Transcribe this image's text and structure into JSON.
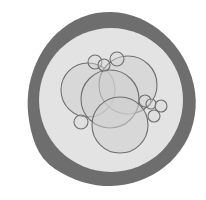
{
  "figure": {
    "width": 206,
    "height": 200,
    "background": "#ffffff",
    "outer_ring": {
      "cx": 111,
      "cy": 100,
      "rx": 84,
      "ry": 87,
      "color": "#6e6e6e"
    },
    "inner_disc": {
      "cx": 111,
      "cy": 100,
      "r": 72,
      "color": "#e3e3e3"
    },
    "circle_style": {
      "fill": "#cfcfcf",
      "fill_opacity": 0.55,
      "stroke": "#6f6f6f",
      "stroke_width": 1.1
    },
    "large_circles": [
      {
        "id": "left",
        "cx": 88,
        "cy": 90,
        "r": 27
      },
      {
        "id": "top-right",
        "cx": 128,
        "cy": 85,
        "r": 29
      },
      {
        "id": "middle",
        "cx": 110,
        "cy": 99,
        "r": 29
      },
      {
        "id": "bottom",
        "cx": 120,
        "cy": 125,
        "r": 28
      }
    ],
    "small_circles": [
      {
        "id": "top-1",
        "cx": 95,
        "cy": 62,
        "r": 7
      },
      {
        "id": "top-2",
        "cx": 104,
        "cy": 65,
        "r": 6
      },
      {
        "id": "top-3",
        "cx": 117,
        "cy": 59,
        "r": 7
      },
      {
        "id": "left-bottom",
        "cx": 81,
        "cy": 122,
        "r": 7
      },
      {
        "id": "right-1",
        "cx": 145,
        "cy": 101,
        "r": 6
      },
      {
        "id": "right-2",
        "cx": 151,
        "cy": 104,
        "r": 5
      },
      {
        "id": "right-3",
        "cx": 161,
        "cy": 106,
        "r": 6
      },
      {
        "id": "right-4",
        "cx": 154,
        "cy": 116,
        "r": 6
      }
    ]
  }
}
